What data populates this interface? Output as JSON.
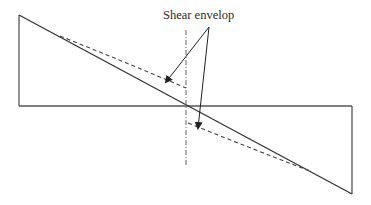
{
  "diagram": {
    "type": "shear force diagram",
    "annotation": {
      "label": "Shear envelop",
      "position": {
        "x": 163,
        "y": 9
      }
    },
    "colors": {
      "background": "#ffffff",
      "line": "#3a3a3a",
      "dashed": "#4a4a4a",
      "centerline": "#5a5a5a",
      "text": "#2a2a2a"
    },
    "baseline": {
      "x1": 19,
      "y1": 106,
      "x2": 352,
      "y2": 106
    },
    "left_ordinate": {
      "x1": 19,
      "y1": 106,
      "x2": 19,
      "y2": 15
    },
    "right_ordinate": {
      "x1": 352,
      "y1": 106,
      "x2": 352,
      "y2": 194
    },
    "shear_line": {
      "x1": 19,
      "y1": 15,
      "x2": 352,
      "y2": 194
    },
    "centerline": {
      "x": 186,
      "y1": 30,
      "y2": 166
    },
    "envelope_upper_path": "M 60 36 Q 125 62 186 88",
    "envelope_lower_path": "M 188 123 Q 250 148 310 171",
    "leader_arrows": [
      {
        "name": "arrow-to-upper-envelope",
        "x1": 209,
        "y1": 27,
        "x2": 166,
        "y2": 82
      },
      {
        "name": "arrow-to-lower-envelope",
        "x1": 209,
        "y1": 27,
        "x2": 198,
        "y2": 128
      }
    ]
  }
}
